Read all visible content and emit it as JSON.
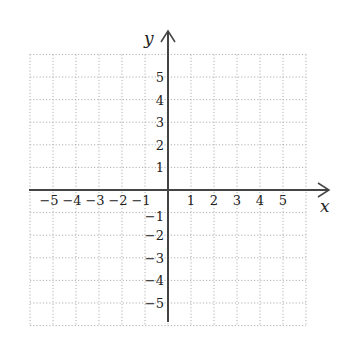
{
  "chart_data": {
    "type": "coordinate-grid",
    "title": "",
    "xlabel": "x",
    "ylabel": "y",
    "xlim": [
      -6,
      6
    ],
    "ylim": [
      -6,
      6
    ],
    "grid": true,
    "grid_style": "dotted",
    "x_ticks": [
      "−5",
      "−4",
      "−3",
      "−2",
      "−1",
      "1",
      "2",
      "3",
      "4",
      "5"
    ],
    "y_ticks": [
      "5",
      "4",
      "3",
      "2",
      "1",
      "−1",
      "−2",
      "−3",
      "−4",
      "−5"
    ]
  },
  "axes": {
    "x_label": "x",
    "y_label": "y"
  },
  "colors": {
    "axis": "#444444",
    "grid": "#aaaaaa",
    "text": "#222222"
  }
}
